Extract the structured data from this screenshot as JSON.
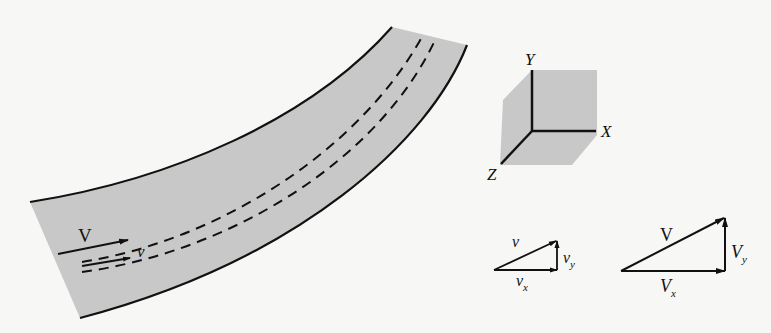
{
  "figure": {
    "type": "flow-in-curved-channel-with-velocity-components",
    "colors": {
      "fill_gray": "#c8c8c8",
      "stroke": "#111111",
      "background": "#f7f7f5"
    }
  },
  "channel": {
    "velocity_label_mean": "V",
    "velocity_label_local": "v",
    "streamlines": 2
  },
  "axes": {
    "x_label": "X",
    "y_label": "Y",
    "z_label": "Z"
  },
  "small_triangle": {
    "hyp_label": "v",
    "vert_label": "v",
    "vert_sub": "y",
    "horiz_label": "v",
    "horiz_sub": "x"
  },
  "large_triangle": {
    "hyp_label": "V",
    "vert_label": "V",
    "vert_sub": "y",
    "horiz_label": "V",
    "horiz_sub": "x"
  }
}
